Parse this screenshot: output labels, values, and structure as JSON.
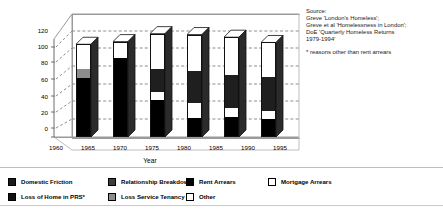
{
  "chart_data": {
    "type": "bar",
    "subtype": "stacked-3d-column",
    "title": "",
    "xlabel": "Year",
    "ylabel": "",
    "ylim": [
      0,
      120
    ],
    "ytick_step": 20,
    "yticks": [
      0,
      20,
      40,
      60,
      80,
      100,
      120
    ],
    "xticks": [
      1960,
      1965,
      1970,
      1975,
      1980,
      1985,
      1990,
      1995
    ],
    "xlim": [
      1960,
      1997
    ],
    "grid": "horizontal-dashed",
    "legend_position": "bottom",
    "categories": [
      "1965",
      "1972",
      "1978",
      "1985",
      "1990",
      "1995"
    ],
    "series": [
      {
        "name": "Domestic Friction",
        "values": [
          68,
          0,
          0,
          0,
          0,
          0
        ]
      },
      {
        "name": "Loss of Home in PRS*",
        "values": [
          0,
          0,
          0,
          0,
          0,
          0
        ]
      },
      {
        "name": "Relationship Breakdown",
        "values": [
          0,
          0,
          26,
          36,
          37,
          38
        ]
      },
      {
        "name": "Loss Service Tenancy",
        "values": [
          10,
          0,
          0,
          0,
          0,
          0
        ]
      },
      {
        "name": "Rent Arrears",
        "values": [
          0,
          90,
          43,
          23,
          24,
          22
        ]
      },
      {
        "name": "Other",
        "values": [
          0,
          0,
          9,
          17,
          10,
          9
        ]
      },
      {
        "name": "Mortgage Arrears",
        "values": [
          27,
          18,
          39,
          40,
          42,
          38
        ]
      }
    ],
    "totals": [
      105,
      108,
      117,
      116,
      113,
      107
    ],
    "annotations": [
      "Source:",
      "Greve 'London's Homeless';",
      "Greve et al 'Homelessness in London';",
      "DoE 'Quarterly Homeless Returns",
      "1979-1994'",
      "* reasons other than rent arrears"
    ]
  },
  "axes": {
    "y_labels": [
      "120",
      "100",
      "80",
      "60",
      "40",
      "20",
      "0"
    ],
    "x_labels": [
      "1960",
      "1965",
      "1970",
      "1975",
      "1980",
      "1985",
      "1990",
      "1995"
    ],
    "x_title": "Year"
  },
  "source": {
    "line1": "Source:",
    "line2": "Greve 'London's Homeless';",
    "line3": "Greve et al 'Homelessness in London';",
    "line4": "DoE 'Quarterly Homeless Returns",
    "line5": "1979-1994'",
    "footnote": "* reasons other than rent arrears"
  },
  "legend": {
    "items": [
      {
        "label": "Domestic Friction",
        "color": "#1a1a1a"
      },
      {
        "label": "Relationship Breakdown",
        "color": "#3d3d3d"
      },
      {
        "label": "Rent Arrears",
        "color": "#000000"
      },
      {
        "label": "Mortgage Arrears",
        "color": "#ffffff"
      },
      {
        "label": "Loss of Home in PRS*",
        "color": "#111111"
      },
      {
        "label": "Loss Service Tenancy",
        "color": "#8c8c8c"
      },
      {
        "label": "Other",
        "color": "#ffffff"
      }
    ]
  },
  "colors": {
    "axis": "#6f6f6f",
    "frame": "#9a9a9a",
    "grid": "#8d8d8d",
    "bar_outline": "#111111",
    "black": "#000000",
    "dark_gray": "#3d3d3d",
    "mid_gray": "#8c8c8c",
    "white": "#ffffff"
  },
  "bars": [
    {
      "year": "1965",
      "left": 76,
      "width": 15,
      "total": 105,
      "segments": [
        {
          "name": "Rent Arrears",
          "value": 68,
          "color": "#000000"
        },
        {
          "name": "Loss Service Tenancy",
          "value": 10,
          "color": "#8c8c8c"
        },
        {
          "name": "Mortgage Arrears",
          "value": 27,
          "color": "#ffffff"
        }
      ]
    },
    {
      "year": "1972",
      "left": 113,
      "width": 15,
      "total": 108,
      "segments": [
        {
          "name": "Rent Arrears",
          "value": 90,
          "color": "#000000"
        },
        {
          "name": "Mortgage Arrears",
          "value": 18,
          "color": "#ffffff"
        }
      ]
    },
    {
      "year": "1978",
      "left": 150,
      "width": 15,
      "total": 117,
      "segments": [
        {
          "name": "Rent Arrears",
          "value": 43,
          "color": "#000000"
        },
        {
          "name": "Other",
          "value": 9,
          "color": "#ffffff"
        },
        {
          "name": "Relationship Breakdown",
          "value": 26,
          "color": "#1f1f1f"
        },
        {
          "name": "Mortgage Arrears",
          "value": 39,
          "color": "#ffffff"
        }
      ]
    },
    {
      "year": "1985",
      "left": 187,
      "width": 15,
      "total": 116,
      "segments": [
        {
          "name": "Rent Arrears",
          "value": 23,
          "color": "#000000"
        },
        {
          "name": "Other",
          "value": 17,
          "color": "#ffffff"
        },
        {
          "name": "Relationship Breakdown",
          "value": 36,
          "color": "#1f1f1f"
        },
        {
          "name": "Mortgage Arrears",
          "value": 40,
          "color": "#ffffff"
        }
      ]
    },
    {
      "year": "1990",
      "left": 224,
      "width": 15,
      "total": 113,
      "segments": [
        {
          "name": "Rent Arrears",
          "value": 24,
          "color": "#000000"
        },
        {
          "name": "Other",
          "value": 10,
          "color": "#ffffff"
        },
        {
          "name": "Relationship Breakdown",
          "value": 37,
          "color": "#1f1f1f"
        },
        {
          "name": "Mortgage Arrears",
          "value": 42,
          "color": "#ffffff"
        }
      ]
    },
    {
      "year": "1995",
      "left": 261,
      "width": 15,
      "total": 107,
      "segments": [
        {
          "name": "Rent Arrears",
          "value": 22,
          "color": "#000000"
        },
        {
          "name": "Other",
          "value": 9,
          "color": "#ffffff"
        },
        {
          "name": "Relationship Breakdown",
          "value": 38,
          "color": "#1f1f1f"
        },
        {
          "name": "Mortgage Arrears",
          "value": 38,
          "color": "#ffffff"
        }
      ]
    }
  ]
}
